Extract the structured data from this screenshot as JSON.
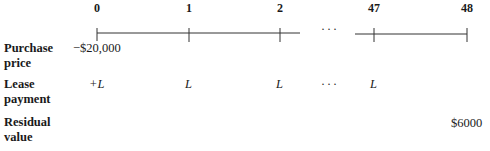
{
  "timeline": {
    "periods": [
      {
        "label": "0",
        "x": 97
      },
      {
        "label": "1",
        "x": 189
      },
      {
        "label": "2",
        "x": 280
      },
      {
        "label": "47",
        "x": 374
      },
      {
        "label": "48",
        "x": 467
      }
    ],
    "gap_symbol": "···"
  },
  "rows": [
    {
      "label_line1": "Purchase",
      "label_line2": "price",
      "cells": [
        {
          "period": "0",
          "value": "−$20,000"
        }
      ]
    },
    {
      "label_line1": "Lease",
      "label_line2": "payment",
      "cells": [
        {
          "period": "0",
          "value": "+L"
        },
        {
          "period": "1",
          "value": "L"
        },
        {
          "period": "2",
          "value": "L"
        },
        {
          "period": "gap",
          "value": "···"
        },
        {
          "period": "47",
          "value": "L"
        }
      ]
    },
    {
      "label_line1": "Residual",
      "label_line2": "value",
      "cells": [
        {
          "period": "48",
          "value": "$6000"
        }
      ]
    }
  ]
}
